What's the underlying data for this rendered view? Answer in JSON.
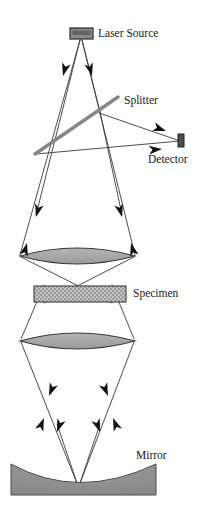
{
  "figure": {
    "background_color": "#ffffff"
  },
  "labels": {
    "laser_source": "Laser Source",
    "splitter": "Splitter",
    "detector": "Detector",
    "specimen": "Specimen",
    "mirror": "Mirror"
  },
  "colors": {
    "line": "#2b2b2b",
    "beam_line": "#3a3a3a",
    "lens_fill": "#a8a8a8",
    "lens_stroke": "#3a3a3a",
    "splitter": "#878787",
    "specimen_fill": "#9a9a9a",
    "specimen_stroke": "#4a4a4a",
    "mirror_fill": "#8f8f8f",
    "mirror_stroke": "#4a4a4a",
    "source_fill": "#8a8a8a",
    "source_stroke": "#2b2b2b",
    "detector_fill": "#4d4d4d",
    "detector_stroke": "#222222",
    "text": "#1a1a1a"
  },
  "components": {
    "laser_source": {
      "x": 70,
      "y": 28,
      "width": 23,
      "height": 11,
      "label_x": 98,
      "label_y": 34
    },
    "splitter": {
      "x1": 35,
      "y1": 154,
      "x2": 118,
      "y2": 97,
      "stroke_width": 3.4,
      "label_x": 124,
      "label_y": 101
    },
    "detector": {
      "x": 178,
      "y": 134,
      "width": 6,
      "height": 13,
      "label_x": 148,
      "label_y": 159
    },
    "objective_lens_upper": {
      "cx": 77,
      "cy": 255,
      "half_width": 58,
      "half_height": 12
    },
    "specimen": {
      "x": 34,
      "y": 286,
      "width": 92,
      "height": 16,
      "label_x": 132,
      "label_y": 294
    },
    "objective_lens_lower": {
      "cx": 77,
      "cy": 340,
      "half_width": 58,
      "half_height": 12
    },
    "mirror": {
      "x": 11,
      "y": 464,
      "width": 145,
      "height": 31,
      "label_x": 135,
      "label_y": 456
    }
  },
  "beam_paths": {
    "source_apex": {
      "x": 81,
      "y": 40
    },
    "focus_upper": {
      "x": 80,
      "y": 162
    },
    "focus_specimen": {
      "x": 78,
      "y": 294
    },
    "focus_lower": {
      "x": 78,
      "y": 430
    },
    "mirror_focus": {
      "x": 78,
      "y": 486
    },
    "lens_left_edge": {
      "x": 20,
      "y": 255
    },
    "lens_right_edge": {
      "x": 135,
      "y": 255
    }
  },
  "arrows": [
    {
      "name": "arrow-source-left",
      "x": 63,
      "y": 74,
      "angle": 200
    },
    {
      "name": "arrow-source-right",
      "x": 92,
      "y": 74,
      "angle": 340
    },
    {
      "name": "arrow-detector-upper",
      "x": 160,
      "y": 127,
      "angle": 22
    },
    {
      "name": "arrow-detector-lower",
      "x": 155,
      "y": 152,
      "angle": 340
    },
    {
      "name": "arrow-lens-upper-left-down",
      "x": 35,
      "y": 215,
      "angle": 200
    },
    {
      "name": "arrow-lens-upper-left-up",
      "x": 30,
      "y": 236,
      "angle": 20
    },
    {
      "name": "arrow-lens-upper-right-down",
      "x": 122,
      "y": 215,
      "angle": 340
    },
    {
      "name": "arrow-lens-upper-right-up",
      "x": 127,
      "y": 236,
      "angle": 160
    },
    {
      "name": "arrow-lens-lower-left-down",
      "x": 49,
      "y": 394,
      "angle": 200
    },
    {
      "name": "arrow-lens-lower-left-up",
      "x": 44,
      "y": 412,
      "angle": 20
    },
    {
      "name": "arrow-lens-lower-right-down",
      "x": 108,
      "y": 394,
      "angle": 340
    },
    {
      "name": "arrow-lens-lower-right-up",
      "x": 113,
      "y": 412,
      "angle": 160
    },
    {
      "name": "arrow-mirror-left",
      "x": 54,
      "y": 438,
      "angle": 200
    },
    {
      "name": "arrow-mirror-right",
      "x": 103,
      "y": 438,
      "angle": 340
    }
  ]
}
